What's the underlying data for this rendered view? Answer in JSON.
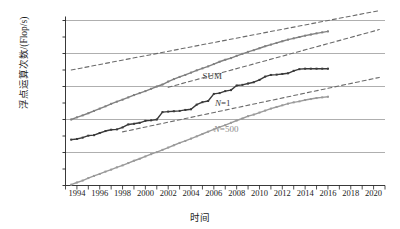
{
  "chart_data": {
    "type": "line",
    "title": "",
    "xlabel": "时间",
    "ylabel": "浮点运算次数/(Flop/s)",
    "x_tick_labels": [
      "1994",
      "1996",
      "1998",
      "2000",
      "2002",
      "2004",
      "2006",
      "2008",
      "2010",
      "2012",
      "2014",
      "2016",
      "2018",
      "2020"
    ],
    "x_tick_values": [
      1994,
      1996,
      1998,
      2000,
      2002,
      2004,
      2006,
      2008,
      2010,
      2012,
      2014,
      2016,
      2018,
      2020
    ],
    "xlim": [
      1993,
      2021
    ],
    "y_tick_labels": [
      "1 E",
      "100 P",
      "10 P",
      "1 P",
      "100 T",
      "10 T",
      "1 T",
      "100 G",
      "10 G",
      "1 G",
      "100 M"
    ],
    "y_tick_exponents": [
      18,
      17,
      16,
      15,
      14,
      13,
      12,
      11,
      10,
      9,
      8
    ],
    "ylim_exponents": [
      8,
      18
    ],
    "gridlines_at": [
      "1 E",
      "10 P",
      "100 T",
      "1 T",
      "10 G"
    ],
    "grid": true,
    "legend_position": "inline-annotations",
    "annotations": [
      {
        "text": "SUM",
        "x": 2005.0,
        "y_exponent": 14.55,
        "color": "#3a3a3a"
      },
      {
        "text": "N=1",
        "x": 2006.1,
        "y_exponent": 12.95,
        "color": "#3a3a3a"
      },
      {
        "text": "N=500",
        "x": 2006.0,
        "y_exponent": 11.35,
        "color": "#8a8a8a"
      }
    ],
    "series": [
      {
        "name": "SUM",
        "style": "solid",
        "color": "#808080",
        "marker": "small-square",
        "x": [
          1993.5,
          1994.0,
          1994.5,
          1995.0,
          1995.5,
          1996.0,
          1996.5,
          1997.0,
          1997.5,
          1998.0,
          1998.5,
          1999.0,
          1999.5,
          2000.0,
          2000.5,
          2001.0,
          2001.5,
          2002.0,
          2002.5,
          2003.0,
          2003.5,
          2004.0,
          2004.5,
          2005.0,
          2005.5,
          2006.0,
          2006.5,
          2007.0,
          2007.5,
          2008.0,
          2008.5,
          2009.0,
          2009.5,
          2010.0,
          2010.5,
          2011.0,
          2011.5,
          2012.0,
          2012.5,
          2013.0,
          2013.5,
          2014.0,
          2014.5,
          2015.0,
          2015.5,
          2016.0
        ],
        "y_exponents": [
          12.0,
          12.13,
          12.25,
          12.38,
          12.52,
          12.66,
          12.8,
          12.95,
          13.08,
          13.2,
          13.34,
          13.48,
          13.6,
          13.72,
          13.86,
          14.0,
          14.12,
          14.3,
          14.45,
          14.58,
          14.7,
          14.84,
          14.98,
          15.1,
          15.22,
          15.36,
          15.5,
          15.62,
          15.72,
          15.86,
          15.98,
          16.1,
          16.2,
          16.32,
          16.44,
          16.54,
          16.64,
          16.74,
          16.84,
          16.92,
          17.0,
          17.08,
          17.15,
          17.22,
          17.28,
          17.34
        ]
      },
      {
        "name": "N=1",
        "style": "solid",
        "color": "#3a3a3a",
        "marker": "small-square",
        "x": [
          1993.5,
          1994.0,
          1994.5,
          1995.0,
          1995.5,
          1996.0,
          1996.5,
          1997.0,
          1997.5,
          1998.0,
          1998.5,
          1999.0,
          1999.5,
          2000.0,
          2000.5,
          2001.0,
          2001.5,
          2002.0,
          2002.5,
          2003.0,
          2003.5,
          2004.0,
          2004.5,
          2005.0,
          2005.5,
          2006.0,
          2006.5,
          2007.0,
          2007.5,
          2008.0,
          2008.5,
          2009.0,
          2009.5,
          2010.0,
          2010.5,
          2011.0,
          2011.5,
          2012.0,
          2012.5,
          2013.0,
          2013.5,
          2014.0,
          2014.5,
          2015.0,
          2015.5,
          2016.0
        ],
        "y_exponents": [
          10.78,
          10.82,
          10.9,
          11.02,
          11.05,
          11.18,
          11.3,
          11.38,
          11.4,
          11.52,
          11.7,
          11.74,
          11.8,
          11.92,
          11.95,
          12.0,
          12.45,
          12.48,
          12.5,
          12.52,
          12.58,
          12.62,
          12.9,
          13.05,
          13.12,
          13.55,
          13.6,
          13.72,
          13.78,
          14.06,
          14.1,
          14.18,
          14.26,
          14.4,
          14.6,
          14.7,
          14.72,
          14.76,
          14.8,
          14.95,
          15.05,
          15.08,
          15.08,
          15.08,
          15.08,
          15.08
        ]
      },
      {
        "name": "N=500",
        "style": "solid",
        "color": "#9a9a9a",
        "marker": "small-square",
        "x": [
          1993.5,
          1994.0,
          1994.5,
          1995.0,
          1995.5,
          1996.0,
          1996.5,
          1997.0,
          1997.5,
          1998.0,
          1998.5,
          1999.0,
          1999.5,
          2000.0,
          2000.5,
          2001.0,
          2001.5,
          2002.0,
          2002.5,
          2003.0,
          2003.5,
          2004.0,
          2004.5,
          2005.0,
          2005.5,
          2006.0,
          2006.5,
          2007.0,
          2007.5,
          2008.0,
          2008.5,
          2009.0,
          2009.5,
          2010.0,
          2010.5,
          2011.0,
          2011.5,
          2012.0,
          2012.5,
          2013.0,
          2013.5,
          2014.0,
          2014.5,
          2015.0,
          2015.5,
          2016.0
        ],
        "y_exponents": [
          8.05,
          8.18,
          8.3,
          8.45,
          8.58,
          8.7,
          8.84,
          8.96,
          9.1,
          9.22,
          9.36,
          9.5,
          9.62,
          9.76,
          9.9,
          10.02,
          10.16,
          10.3,
          10.44,
          10.58,
          10.7,
          10.84,
          10.98,
          11.12,
          11.26,
          11.4,
          11.54,
          11.66,
          11.8,
          11.94,
          12.06,
          12.2,
          12.3,
          12.42,
          12.54,
          12.66,
          12.76,
          12.86,
          12.96,
          13.04,
          13.1,
          13.18,
          13.24,
          13.3,
          13.34,
          13.38
        ]
      },
      {
        "name": "SUM-projection",
        "style": "dashed",
        "color": "#6b6b6b",
        "x": [
          1993.5,
          2020.5
        ],
        "y_exponents": [
          15.0,
          18.6
        ]
      },
      {
        "name": "N=1-projection",
        "style": "dashed",
        "color": "#6b6b6b",
        "x": [
          2002.0,
          2020.5
        ],
        "y_exponents": [
          13.95,
          17.45
        ]
      },
      {
        "name": "N=500-projection",
        "style": "dashed",
        "color": "#6b6b6b",
        "x": [
          1998.0,
          2020.5
        ],
        "y_exponents": [
          11.25,
          14.55
        ]
      }
    ]
  }
}
